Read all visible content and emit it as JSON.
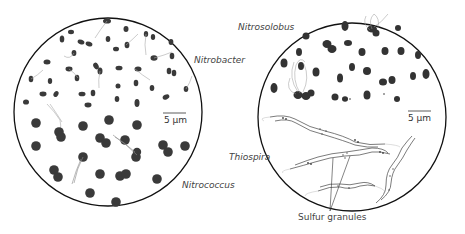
{
  "panels": [
    {
      "id": "left",
      "organisms": [
        "Nitrobacter",
        "Nitrococcus"
      ],
      "scale_bar": "5 µm"
    },
    {
      "id": "right",
      "organisms": [
        "Nitrosolobus",
        "Thiospira"
      ],
      "scale_bar": "5 µm",
      "annotation": "Sulfur granules"
    }
  ],
  "labels": {
    "nitrobacter": "Nitrobacter",
    "nitrococcus": "Nitrococcus",
    "nitrosolobus": "Nitrosolobus",
    "thiospira": "Thiospira",
    "sulfur_granules": "Sulfur granules",
    "scale_left": "5 µm",
    "scale_right": "5 µm"
  },
  "colors": {
    "cell": "#3a3a3a",
    "outline": "#111111",
    "flagella": "#999999"
  }
}
